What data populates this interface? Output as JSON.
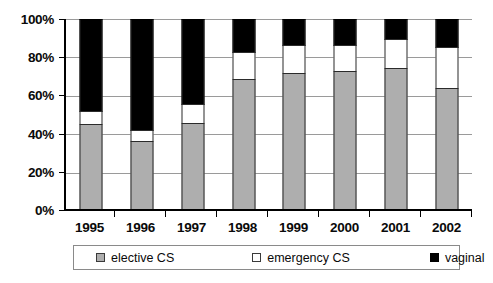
{
  "chart_data": {
    "type": "bar",
    "subtype": "stacked-100-percent",
    "title": "",
    "xlabel": "",
    "ylabel": "",
    "categories": [
      "1995",
      "1996",
      "1997",
      "1998",
      "1999",
      "2000",
      "2001",
      "2002"
    ],
    "series": [
      {
        "name": "elective CS",
        "color": "#aeaeae",
        "values": [
          44,
          35,
          45,
          68,
          71,
          72,
          73.5,
          63
        ]
      },
      {
        "name": "emergency CS",
        "color": "#ffffff",
        "values": [
          7,
          6,
          10,
          14,
          15,
          14,
          15.5,
          22
        ]
      },
      {
        "name": "vaginal",
        "color": "#000000",
        "values": [
          49,
          59,
          45,
          18,
          14,
          14,
          11,
          15
        ]
      }
    ],
    "ylim": [
      0,
      100
    ],
    "ytick_labels": [
      "0%",
      "20%",
      "40%",
      "60%",
      "80%",
      "100%"
    ],
    "ytick_values": [
      0,
      20,
      40,
      60,
      80,
      100
    ],
    "grid": true,
    "grid_axis": "y",
    "legend_position": "bottom",
    "stack_order_bottom_to_top": [
      "elective CS",
      "emergency CS",
      "vaginal"
    ]
  },
  "axes": {
    "y": {
      "ticks": [
        {
          "label": "100%",
          "value": 100
        },
        {
          "label": "80%",
          "value": 80
        },
        {
          "label": "60%",
          "value": 60
        },
        {
          "label": "40%",
          "value": 40
        },
        {
          "label": "20%",
          "value": 20
        },
        {
          "label": "0%",
          "value": 0
        }
      ]
    },
    "x": {
      "ticks": [
        "1995",
        "1996",
        "1997",
        "1998",
        "1999",
        "2000",
        "2001",
        "2002"
      ]
    }
  },
  "legend": {
    "items": [
      {
        "label": "elective CS",
        "swatch": "gray-swatch-icon"
      },
      {
        "label": "emergency CS",
        "swatch": "white-swatch-icon"
      },
      {
        "label": "vaginal",
        "swatch": "black-swatch-icon"
      }
    ]
  },
  "colors": {
    "elective": "#aeaeae",
    "emergency": "#ffffff",
    "vaginal": "#000000",
    "axis": "#000000",
    "grid": "#9a9a9a"
  }
}
